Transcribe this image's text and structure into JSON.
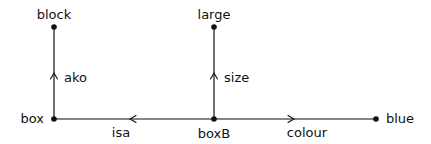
{
  "diagram": {
    "type": "semantic-network",
    "nodes": [
      {
        "id": "block",
        "label": "block",
        "x": 54,
        "y": 27
      },
      {
        "id": "large",
        "label": "large",
        "x": 214,
        "y": 27
      },
      {
        "id": "box",
        "label": "box",
        "x": 54,
        "y": 119
      },
      {
        "id": "boxB",
        "label": "boxB",
        "x": 214,
        "y": 119
      },
      {
        "id": "blue",
        "label": "blue",
        "x": 376,
        "y": 119
      }
    ],
    "edges": [
      {
        "id": "ako",
        "label": "ako",
        "from": "box",
        "to": "block"
      },
      {
        "id": "size",
        "label": "size",
        "from": "boxB",
        "to": "large"
      },
      {
        "id": "isa",
        "label": "isa",
        "from": "boxB",
        "to": "box"
      },
      {
        "id": "colour",
        "label": "colour",
        "from": "boxB",
        "to": "blue"
      }
    ],
    "colors": {
      "ink": "#111111",
      "background": "#ffffff"
    }
  }
}
